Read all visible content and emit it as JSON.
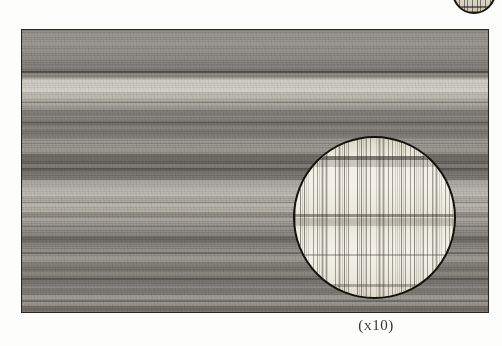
{
  "page": {
    "background_color": "#fdfdfc",
    "kind": "printed-plate"
  },
  "top_fragment": {
    "name": "clipped-circular-figure-above",
    "description": "bottom arc of a circular photomicrograph from the figure above, cut off by the page edge",
    "outline_color": "#17150f",
    "fill_color": "#e0dbcd"
  },
  "photo": {
    "name": "wood-grain-photograph",
    "description": "black and white photograph of planed wood showing horizontal grain bands",
    "border_color": "#2b2722",
    "base_color": "#8f8c86",
    "light_band_color": "#c3c0b6",
    "dark_band_color": "#6b6863"
  },
  "magnifier": {
    "name": "magnified-circular-inset",
    "description": "circular inset showing the same wood surface at ten times magnification with fine vertical rays",
    "outline_color": "#14120d",
    "fill_color": "#f2efe5",
    "ray_color": "#302c22",
    "magnification": "x10"
  },
  "caption": {
    "text": "(x10)",
    "color": "#3a352c"
  }
}
